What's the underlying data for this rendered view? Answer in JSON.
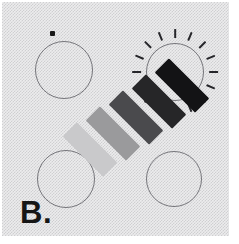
{
  "figure": {
    "panel_label": "B.",
    "background_color": "#ececed",
    "width": 239,
    "height": 244
  },
  "circles": [
    {
      "id": "circle-top-left",
      "name": "circle-top-left",
      "cx": 64,
      "cy": 70,
      "r": 29,
      "highlighted": false,
      "stroke": "#75757a"
    },
    {
      "id": "circle-top-right",
      "name": "circle-top-right",
      "cx": 175,
      "cy": 72,
      "r": 29,
      "highlighted": true,
      "stroke": "#75757a"
    },
    {
      "id": "circle-bottom-left",
      "name": "circle-bottom-left",
      "cx": 66,
      "cy": 179,
      "r": 29,
      "highlighted": false,
      "stroke": "#75757a"
    },
    {
      "id": "circle-bottom-right",
      "name": "circle-bottom-right",
      "cx": 174,
      "cy": 179,
      "r": 28,
      "highlighted": false,
      "stroke": "#75757a"
    }
  ],
  "marker_dot": {
    "name": "marker-dot",
    "cx": 52,
    "cy": 33,
    "size": 5,
    "color": "#1a1a1a"
  },
  "sun_rays": {
    "name": "sun-ray-burst",
    "count": 16,
    "inner_radius": 34,
    "length": 9,
    "color": "#26262a",
    "attached_to": "circle-top-right"
  },
  "gradient_bars": {
    "name": "gradient-bar-stack",
    "rotation_deg": -45,
    "bar_width": 20,
    "bar_length": 57,
    "step": 23,
    "axis_start": {
      "x": 90,
      "y": 149
    },
    "bars": [
      {
        "index": 0,
        "shade_label": "lightest",
        "color": "#c9c9cb",
        "cx": 90,
        "cy": 149
      },
      {
        "index": 1,
        "shade_label": "light",
        "color": "#9a9a9c",
        "cx": 113,
        "cy": 133
      },
      {
        "index": 2,
        "shade_label": "medium",
        "color": "#4a4a4d",
        "cx": 136,
        "cy": 117
      },
      {
        "index": 3,
        "shade_label": "dark",
        "color": "#262628",
        "cx": 159,
        "cy": 101
      },
      {
        "index": 4,
        "shade_label": "darkest",
        "color": "#131315",
        "cx": 182,
        "cy": 85
      }
    ]
  },
  "chart_data": {
    "type": "diagram",
    "title": "B.",
    "elements": [
      {
        "label": "marker dot",
        "value": "small filled square near top-left circle"
      },
      {
        "label": "bar 1 shade",
        "value": "#c9c9cb"
      },
      {
        "label": "bar 2 shade",
        "value": "#9a9a9c"
      },
      {
        "label": "bar 3 shade",
        "value": "#4a4a4d"
      },
      {
        "label": "bar 4 shade",
        "value": "#262628"
      },
      {
        "label": "bar 5 shade",
        "value": "#131315"
      },
      {
        "label": "ray count",
        "value": 16
      },
      {
        "label": "circle count",
        "value": 4
      }
    ]
  }
}
